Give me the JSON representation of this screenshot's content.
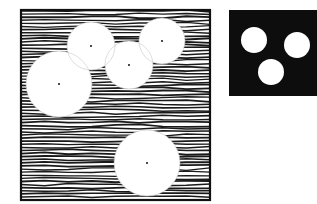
{
  "figure": {
    "left_panel": {
      "description": "Hatched square field with five white circular openings, each with a center dot",
      "box": {
        "x": 21,
        "y": 10,
        "width": 189,
        "height": 190
      },
      "hatch_color": "#1a1a1a",
      "circles": [
        {
          "cx": 91,
          "cy": 46,
          "r": 24
        },
        {
          "cx": 59,
          "cy": 84,
          "r": 33
        },
        {
          "cx": 129,
          "cy": 65,
          "r": 24
        },
        {
          "cx": 162,
          "cy": 41,
          "r": 23
        },
        {
          "cx": 147,
          "cy": 163,
          "r": 33
        }
      ]
    },
    "right_panel": {
      "description": "Solid black square with three white circles",
      "box": {
        "x": 229,
        "y": 10,
        "width": 88,
        "height": 86
      },
      "fill_color": "#0d0d0d",
      "circles": [
        {
          "cx": 254,
          "cy": 40,
          "r": 13
        },
        {
          "cx": 297,
          "cy": 45,
          "r": 13
        },
        {
          "cx": 271,
          "cy": 72,
          "r": 13
        }
      ]
    }
  }
}
